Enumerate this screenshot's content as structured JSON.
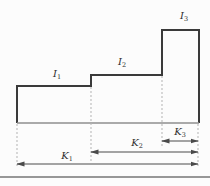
{
  "figure": {
    "labels": {
      "i1": {
        "base": "I",
        "sub": "1"
      },
      "i2": {
        "base": "I",
        "sub": "2"
      },
      "i3": {
        "base": "I",
        "sub": "3"
      },
      "k1": {
        "base": "K",
        "sub": "1"
      },
      "k2": {
        "base": "K",
        "sub": "2"
      },
      "k3": {
        "base": "K",
        "sub": "3"
      }
    },
    "colors": {
      "outline": "#3a3a3a",
      "baseline": "#8f8f8f",
      "dimension": "#4a4a4a",
      "extension": "#b3b3b3",
      "frame": "#979797",
      "background": "#fcfcfc"
    }
  }
}
